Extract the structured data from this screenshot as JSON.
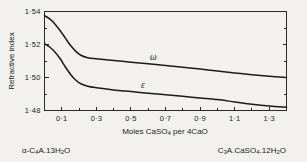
{
  "chart_data": {
    "type": "line",
    "title": "",
    "xlabel": "Moles CaSO4 per 4CaO",
    "ylabel": "Refractive index",
    "xlim": [
      0.0,
      1.4
    ],
    "ylim": [
      1.48,
      1.54
    ],
    "grid": false,
    "legend_position": "inline-curve-labels",
    "x_ticks": [
      0.1,
      0.3,
      0.5,
      0.7,
      0.9,
      1.1,
      1.3
    ],
    "x_tick_labels": [
      "0·1",
      "0·3",
      "0·5",
      "0·7",
      "0·9",
      "1·1",
      "1·3"
    ],
    "x_minor_ticks": [
      0.0,
      0.2,
      0.4,
      0.6,
      0.8,
      1.0,
      1.2,
      1.4
    ],
    "y_ticks": [
      1.48,
      1.5,
      1.52,
      1.54
    ],
    "y_tick_labels": [
      "1·48",
      "1·50",
      "1·52",
      "1·54"
    ],
    "y_minor_ticks": [
      1.49,
      1.51,
      1.53
    ],
    "series": [
      {
        "name": "ω",
        "label": "ω",
        "color": "#1b1b1a",
        "x": [
          0.0,
          0.03,
          0.06,
          0.09,
          0.12,
          0.15,
          0.18,
          0.21,
          0.25,
          0.3,
          0.4,
          0.5,
          0.6,
          0.7,
          0.8,
          0.9,
          1.0,
          1.1,
          1.2,
          1.3,
          1.4
        ],
        "y": [
          1.5375,
          1.5355,
          1.5325,
          1.5285,
          1.524,
          1.5195,
          1.516,
          1.5135,
          1.512,
          1.5113,
          1.5103,
          1.5093,
          1.5083,
          1.5073,
          1.5062,
          1.5051,
          1.504,
          1.5028,
          1.5017,
          1.5008,
          1.5
        ]
      },
      {
        "name": "ε",
        "label": "ε",
        "color": "#1b1b1a",
        "x": [
          0.0,
          0.03,
          0.06,
          0.09,
          0.12,
          0.15,
          0.18,
          0.21,
          0.25,
          0.3,
          0.4,
          0.5,
          0.6,
          0.7,
          0.8,
          0.9,
          1.0,
          1.1,
          1.2,
          1.3,
          1.4
        ],
        "y": [
          1.5205,
          1.5185,
          1.5155,
          1.5115,
          1.5065,
          1.502,
          1.4985,
          1.4962,
          1.4947,
          1.4938,
          1.4925,
          1.4915,
          1.4905,
          1.4896,
          1.4886,
          1.4876,
          1.4866,
          1.4852,
          1.4838,
          1.4827,
          1.482
        ]
      }
    ]
  },
  "axis": {
    "y_title": "Refractive index",
    "x_title_parts": {
      "lead": "Moles CaSO",
      "sub1": "4",
      "mid": " per 4CaO"
    }
  },
  "curve_labels": {
    "omega": "ω",
    "epsilon": "ε"
  },
  "endpoint_labels": {
    "left": {
      "full": "α-C4A.13H2O",
      "parts": [
        {
          "t": "α-C",
          "sub": false
        },
        {
          "t": "4",
          "sub": true
        },
        {
          "t": "A.13H",
          "sub": false
        },
        {
          "t": "2",
          "sub": true
        },
        {
          "t": "O",
          "sub": false
        }
      ]
    },
    "right": {
      "full": "C3A.CaSO4.12H2O",
      "parts": [
        {
          "t": "C",
          "sub": false
        },
        {
          "t": "3",
          "sub": true
        },
        {
          "t": "A.CaSO",
          "sub": false
        },
        {
          "t": "4",
          "sub": true
        },
        {
          "t": ".12H",
          "sub": false
        },
        {
          "t": "2",
          "sub": true
        },
        {
          "t": "O",
          "sub": false
        }
      ]
    }
  },
  "colors": {
    "background": "#f2f1ed",
    "ink": "#1b1b1a",
    "axis": "#2a2a28"
  }
}
